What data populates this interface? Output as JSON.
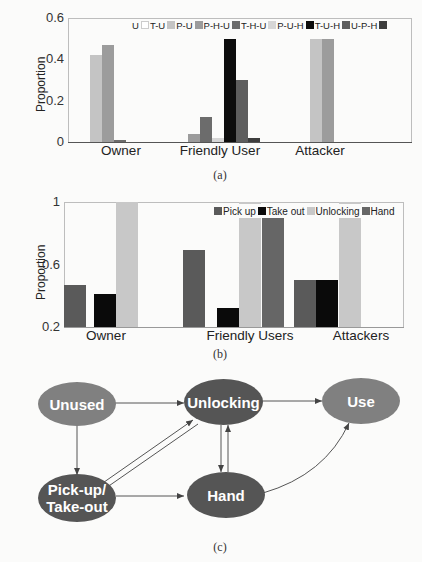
{
  "chart_data": [
    {
      "id": "a",
      "type": "bar",
      "title": "",
      "caption": "(a)",
      "xlabel": "",
      "ylabel": "Proportion",
      "ylim": [
        0,
        0.6
      ],
      "yticks": [
        "0",
        "0.2",
        "0.4",
        "0.6"
      ],
      "categories": [
        "Owner",
        "Friendly User",
        "Attacker"
      ],
      "legend_position": "top",
      "series": [
        {
          "name": "U",
          "color": "#ffffff",
          "values": [
            0.0,
            0.0,
            0.0
          ]
        },
        {
          "name": "T-U",
          "color": "#c4c4c4",
          "values": [
            0.42,
            0.0,
            0.5
          ]
        },
        {
          "name": "P-U",
          "color": "#9c9c9c",
          "values": [
            0.47,
            0.04,
            0.5
          ]
        },
        {
          "name": "P-H-U",
          "color": "#6c6c6c",
          "values": [
            0.01,
            0.12,
            0.0
          ]
        },
        {
          "name": "T-H-U",
          "color": "#d6d6d6",
          "values": [
            0.0,
            0.02,
            0.0
          ]
        },
        {
          "name": "P-U-H",
          "color": "#0d0d0d",
          "values": [
            0.0,
            0.5,
            0.0
          ]
        },
        {
          "name": "T-U-H",
          "color": "#5e5e5e",
          "values": [
            0.0,
            0.3,
            0.0
          ]
        },
        {
          "name": "U-P-H",
          "color": "#3d3d3d",
          "values": [
            0.0,
            0.02,
            0.0
          ]
        }
      ]
    },
    {
      "id": "b",
      "type": "bar",
      "title": "",
      "caption": "(b)",
      "xlabel": "",
      "ylabel": "Proportion",
      "ylim": [
        0.2,
        1.0
      ],
      "yticks": [
        "0.2",
        "0.6",
        "1"
      ],
      "categories": [
        "Owner",
        "Friendly Users",
        "Attackers"
      ],
      "legend_position": "top-right",
      "series": [
        {
          "name": "Pick up",
          "color": "#5a5a5a",
          "values": [
            0.47,
            0.69,
            0.5
          ]
        },
        {
          "name": "Take out",
          "color": "#0a0a0a",
          "values": [
            0.41,
            0.32,
            0.5
          ]
        },
        {
          "name": "Unlocking",
          "color": "#c8c8c8",
          "values": [
            1.0,
            1.0,
            1.0
          ]
        },
        {
          "name": "Hand",
          "color": "#666666",
          "values": [
            0.0,
            0.93,
            0.0
          ]
        }
      ]
    }
  ],
  "diagram": {
    "caption": "(c)",
    "nodes": [
      {
        "id": "unused",
        "label": "Unused"
      },
      {
        "id": "unlocking",
        "label": "Unlocking"
      },
      {
        "id": "use",
        "label": "Use"
      },
      {
        "id": "pickup",
        "label": "Pick-up/ Take-out"
      },
      {
        "id": "hand",
        "label": "Hand"
      }
    ],
    "edges": [
      [
        "unused",
        "unlocking"
      ],
      [
        "unlocking",
        "use"
      ],
      [
        "unused",
        "pickup"
      ],
      [
        "pickup",
        "unlocking"
      ],
      [
        "unlocking",
        "pickup"
      ],
      [
        "pickup",
        "hand"
      ],
      [
        "unlocking",
        "hand"
      ],
      [
        "hand",
        "unlocking"
      ],
      [
        "hand",
        "use"
      ]
    ]
  }
}
